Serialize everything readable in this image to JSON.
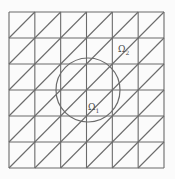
{
  "diagram": {
    "type": "triangular-mesh-with-circular-interface",
    "grid": {
      "cols": 6,
      "rows": 6,
      "x0": 9,
      "y0": 12,
      "x1": 164,
      "y1": 168,
      "diagonal_direction": "bottom-left-to-top-right"
    },
    "circle": {
      "cx": 88,
      "cy": 90,
      "r": 32
    },
    "colors": {
      "background": "#fbfbfb",
      "line": "#6b6b6b",
      "label": "#4a4a4a"
    },
    "labels": [
      {
        "id": "omega1",
        "symbol": "Ω",
        "subscript": "1",
        "x": 88,
        "y": 103
      },
      {
        "id": "omega2",
        "symbol": "Ω",
        "subscript": "2",
        "x": 118,
        "y": 45
      }
    ]
  }
}
